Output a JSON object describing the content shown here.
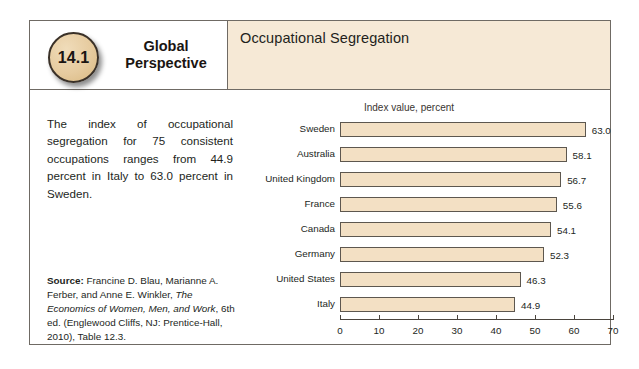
{
  "figure": {
    "badge_number": "14.1",
    "title_line1": "Global",
    "title_line2": "Perspective",
    "subject": "Occupational Segregation",
    "intro_text": "The index of occupational segregation for 75 consistent occupations ranges from 44.9 percent in Italy to 63.0 percent in Sweden.",
    "source_label": "Source:",
    "source_part1": " Francine D. Blau, Marianne A. Ferber, and Anne E. Winkler, ",
    "source_italic": "The Economics of Women, Men, and Work",
    "source_part2": ", 6th ed. (Englewood Cliffs, NJ: Prentice-Hall, 2010), Table 12.3."
  },
  "colors": {
    "header_band": "#f6e9d6",
    "badge": "#e6cb9f",
    "bar_fill": "#f3e0c4",
    "bar_border": "#5d574f",
    "frame": "#6f6a64"
  },
  "chart_data": {
    "type": "bar",
    "orientation": "horizontal",
    "title": "Index value, percent",
    "xlabel": "",
    "ylabel": "",
    "xlim": [
      0,
      70
    ],
    "xticks": [
      0,
      10,
      20,
      30,
      40,
      50,
      60,
      70
    ],
    "xtick_labels": [
      "0",
      "10",
      "20",
      "30",
      "40",
      "50",
      "60",
      "70"
    ],
    "grid": false,
    "legend": false,
    "categories": [
      "Sweden",
      "Australia",
      "United Kingdom",
      "France",
      "Canada",
      "Germany",
      "United States",
      "Italy"
    ],
    "values": [
      63.0,
      58.1,
      56.7,
      55.6,
      54.1,
      52.3,
      46.3,
      44.9
    ],
    "data_labels": [
      "63.0",
      "58.1",
      "56.7",
      "55.6",
      "54.1",
      "52.3",
      "46.3",
      "44.9"
    ]
  }
}
